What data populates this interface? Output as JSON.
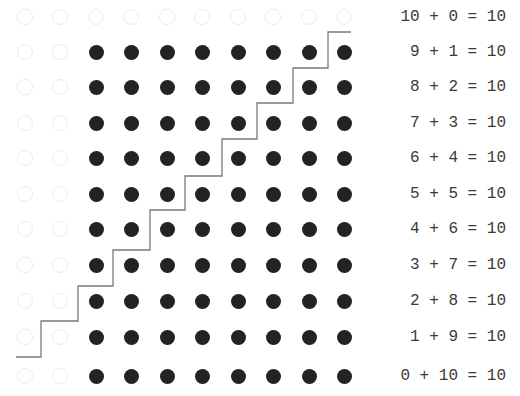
{
  "diagram": {
    "grid": {
      "columns": 10,
      "rows": 11,
      "col_x": [
        25,
        60,
        96,
        131,
        167,
        202,
        238,
        273,
        309,
        344
      ],
      "row_y": [
        17,
        52,
        87,
        123,
        158,
        194,
        229,
        265,
        301,
        337,
        376
      ],
      "filled_color": "#232323",
      "hollow_color": "#ececec",
      "rows_pattern": [
        [
          0,
          0,
          0,
          0,
          0,
          0,
          0,
          0,
          0,
          0
        ],
        [
          0,
          0,
          1,
          1,
          1,
          1,
          1,
          1,
          1,
          1
        ],
        [
          0,
          0,
          1,
          1,
          1,
          1,
          1,
          1,
          1,
          1
        ],
        [
          0,
          0,
          1,
          1,
          1,
          1,
          1,
          1,
          1,
          1
        ],
        [
          0,
          0,
          1,
          1,
          1,
          1,
          1,
          1,
          1,
          1
        ],
        [
          0,
          0,
          1,
          1,
          1,
          1,
          1,
          1,
          1,
          1
        ],
        [
          0,
          0,
          1,
          1,
          1,
          1,
          1,
          1,
          1,
          1
        ],
        [
          0,
          0,
          1,
          1,
          1,
          1,
          1,
          1,
          1,
          1
        ],
        [
          0,
          0,
          1,
          1,
          1,
          1,
          1,
          1,
          1,
          1
        ],
        [
          0,
          0,
          1,
          1,
          1,
          1,
          1,
          1,
          1,
          1
        ],
        [
          0,
          0,
          1,
          1,
          1,
          1,
          1,
          1,
          1,
          1
        ]
      ]
    },
    "staircase": {
      "color": "#7a7a7a",
      "points": "16,357 41,357 41,321 78,321 78,286 113,286 113,250 150,250 150,210 185,210 185,176 222,176 222,139 257,139 257,103 293,103 293,68 328,68 328,32 351,32"
    },
    "equations": [
      "10 + 0 = 10",
      "9 + 1 = 10",
      "8 + 2 = 10",
      "7 + 3 = 10",
      "6 + 4 = 10",
      "5 + 5 = 10",
      "4 + 6 = 10",
      "3 + 7 = 10",
      "2 + 8 = 10",
      "1 + 9 = 10",
      "0 + 10 = 10"
    ]
  }
}
